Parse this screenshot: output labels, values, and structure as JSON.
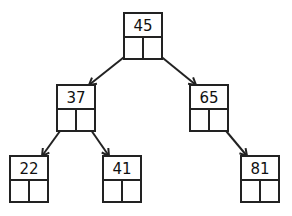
{
  "diagram": {
    "type": "binary-search-tree",
    "nodes": [
      {
        "id": "n45",
        "value": "45",
        "left": "n37",
        "right": "n65"
      },
      {
        "id": "n37",
        "value": "37",
        "left": "n22",
        "right": "n41"
      },
      {
        "id": "n65",
        "value": "65",
        "left": null,
        "right": "n81"
      },
      {
        "id": "n22",
        "value": "22",
        "left": null,
        "right": null
      },
      {
        "id": "n41",
        "value": "41",
        "left": null,
        "right": null
      },
      {
        "id": "n81",
        "value": "81",
        "left": null,
        "right": null
      }
    ],
    "edges": [
      {
        "from": "n45",
        "to": "n37",
        "side": "left"
      },
      {
        "from": "n45",
        "to": "n65",
        "side": "right"
      },
      {
        "from": "n37",
        "to": "n22",
        "side": "left"
      },
      {
        "from": "n37",
        "to": "n41",
        "side": "right"
      },
      {
        "from": "n65",
        "to": "n81",
        "side": "right"
      }
    ],
    "colors": {
      "stroke": "#222222",
      "text": "#111111",
      "background": "#ffffff"
    }
  }
}
